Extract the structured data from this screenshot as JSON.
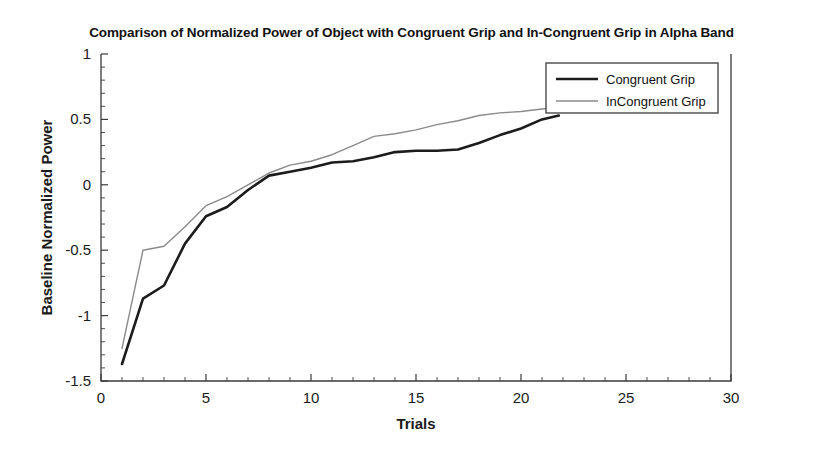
{
  "chart_data": {
    "type": "line",
    "title": "Comparison of Normalized Power of Object with Congruent Grip and In-Congruent Grip in Alpha Band",
    "xlabel": "Trials",
    "ylabel": "Baseline Normalized Power",
    "xlim": [
      0,
      30
    ],
    "ylim": [
      -1.5,
      1
    ],
    "xticks": [
      0,
      5,
      10,
      15,
      20,
      25,
      30
    ],
    "xtick_labels": [
      "0",
      "5",
      "10",
      "15",
      "20",
      "25",
      "30"
    ],
    "yticks": [
      -1.5,
      -1,
      -0.5,
      0,
      0.5,
      1
    ],
    "ytick_labels": [
      "-1.5",
      "-1",
      "-0.5",
      "0",
      "0.5",
      "1"
    ],
    "grid": false,
    "legend_position": "upper right",
    "x": [
      1,
      2,
      3,
      4,
      5,
      6,
      7,
      8,
      9,
      10,
      11,
      12,
      13,
      14,
      15,
      16,
      17,
      18,
      19,
      20,
      21,
      21.8
    ],
    "series": [
      {
        "name": "Congruent Grip",
        "color": "#1c1c1c",
        "width": 2.6,
        "values": [
          -1.37,
          -0.87,
          -0.77,
          -0.45,
          -0.24,
          -0.17,
          -0.04,
          0.07,
          0.1,
          0.13,
          0.17,
          0.18,
          0.21,
          0.25,
          0.26,
          0.26,
          0.27,
          0.32,
          0.38,
          0.43,
          0.5,
          0.53
        ]
      },
      {
        "name": "InCongruent Grip",
        "color": "#8a8a8a",
        "width": 1.4,
        "values": [
          -1.25,
          -0.5,
          -0.47,
          -0.32,
          -0.16,
          -0.09,
          0.0,
          0.09,
          0.15,
          0.18,
          0.23,
          0.3,
          0.37,
          0.39,
          0.42,
          0.46,
          0.49,
          0.53,
          0.55,
          0.56,
          0.58,
          0.59
        ]
      }
    ]
  },
  "legend": {
    "entries": [
      {
        "label": "Congruent Grip"
      },
      {
        "label": "InCongruent Grip"
      }
    ]
  }
}
